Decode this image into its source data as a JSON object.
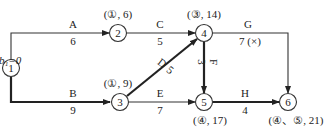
{
  "diagram": {
    "type": "activity-on-arrow network (critical path)",
    "start_label": "b₁=0",
    "nodes": [
      {
        "id": "1",
        "x": 11,
        "y": 68,
        "annotation": ""
      },
      {
        "id": "2",
        "x": 118,
        "y": 33,
        "annotation": "(①, 6)"
      },
      {
        "id": "3",
        "x": 120,
        "y": 102,
        "annotation": "(①, 9)"
      },
      {
        "id": "4",
        "x": 204,
        "y": 33,
        "annotation": "(③, 14)"
      },
      {
        "id": "5",
        "x": 204,
        "y": 102,
        "annotation": "(④, 17)"
      },
      {
        "id": "6",
        "x": 288,
        "y": 102,
        "annotation": "(④、⑤, 21)"
      }
    ],
    "activities": [
      {
        "name": "A",
        "from": "1",
        "to": "2",
        "duration": "6",
        "critical": false
      },
      {
        "name": "B",
        "from": "1",
        "to": "3",
        "duration": "9",
        "critical": true
      },
      {
        "name": "C",
        "from": "2",
        "to": "4",
        "duration": "5",
        "critical": false
      },
      {
        "name": "D",
        "from": "3",
        "to": "4",
        "duration": "5",
        "critical": true
      },
      {
        "name": "E",
        "from": "3",
        "to": "5",
        "duration": "7",
        "critical": false
      },
      {
        "name": "F",
        "from": "4",
        "to": "5",
        "duration": "3",
        "critical": true
      },
      {
        "name": "G",
        "from": "4",
        "to": "6",
        "duration": "7 (×)",
        "critical": false
      },
      {
        "name": "H",
        "from": "5",
        "to": "6",
        "duration": "4",
        "critical": true
      }
    ]
  }
}
